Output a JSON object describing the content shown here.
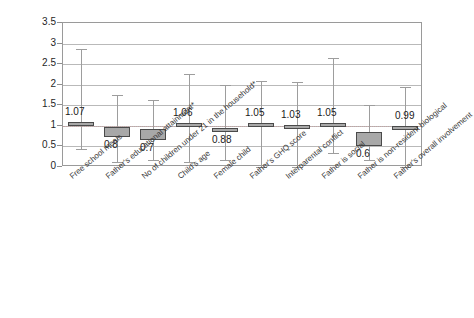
{
  "chart_data": {
    "type": "bar",
    "title": "",
    "subtitle": "",
    "xlabel": "",
    "ylabel": "",
    "ylim": [
      0,
      3.5
    ],
    "xlim": [
      0,
      10
    ],
    "grid": true,
    "legend": "none",
    "reference_line": 1,
    "y_ticks": [
      "0",
      "0.5",
      "1",
      "1.5",
      "2",
      "2.5",
      "3",
      "3.5"
    ],
    "y_tick_values": [
      0,
      0.5,
      1,
      1.5,
      2,
      2.5,
      3,
      3.5
    ],
    "categories": [
      "Free school meals",
      "Father's educational attainment*",
      "No of children under 21 in the household*",
      "Child's age",
      "Female child",
      "Father's GHQ score",
      "Interparental conflict",
      "Father is social",
      "Father is non-resident biological",
      "Father's overall involvement"
    ],
    "values": [
      1.07,
      0.8,
      0.7,
      1.06,
      0.88,
      1.05,
      1.03,
      1.05,
      0.6,
      0.99
    ],
    "value_labels": [
      "1.07",
      "0.8",
      "0.7",
      "1.06",
      "0.88",
      "1.05",
      "1.03",
      "1.05",
      "0.6",
      "0.99"
    ],
    "series": [
      {
        "name": "Odds ratio box",
        "box_low": [
          0.99,
          0.72,
          0.65,
          0.99,
          0.85,
          0.97,
          0.97,
          0.97,
          0.5,
          0.97
        ],
        "box_high": [
          1.09,
          0.98,
          0.93,
          1.08,
          0.96,
          1.06,
          1.03,
          1.06,
          0.86,
          1.0
        ]
      },
      {
        "name": "Whisker range",
        "whisker_low": [
          0.43,
          0.11,
          0.17,
          0.13,
          0.18,
          0.01,
          0.01,
          0.33,
          0.17,
          -0.03
        ],
        "whisker_high": [
          2.88,
          1.76,
          1.63,
          2.25,
          2.0,
          2.1,
          2.06,
          2.65,
          1.5,
          1.95
        ]
      }
    ],
    "label_positions": [
      "above",
      "below",
      "below",
      "above",
      "below",
      "above",
      "above",
      "above",
      "below",
      "above"
    ],
    "colors": {
      "box_fill": "#a8a8a8",
      "box_border": "#4a4a4a",
      "whisker": "#9d9d9d",
      "gridline": "#b9b9b9",
      "frame": "#9a9a9a",
      "text": "#1f1f1f",
      "background": "#ffffff"
    }
  }
}
